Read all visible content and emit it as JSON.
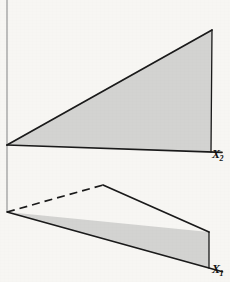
{
  "figure": {
    "title": "",
    "background_color": "#f7f6f3",
    "shade_color": "#d3d3d1",
    "line_color": "#1a1a1a",
    "axis_guide_color": "#8d8d8d",
    "labels": {
      "x2": {
        "base": "X",
        "subscript": "2",
        "name": "x2-axis-label"
      },
      "x1": {
        "base": "X",
        "subscript": "1",
        "name": "x1-axis-label"
      }
    },
    "geometry": {
      "description": "Two shaded planar wedges (cones) emanating from two vertices on a vertical reference line, crossing each other; hidden edge drawn dashed.",
      "vertical_guide": {
        "x": 7,
        "y_top": 0,
        "y_bottom": 212
      },
      "vertex_upper": {
        "x": 7,
        "y": 145
      },
      "vertex_lower": {
        "x": 7,
        "y": 212
      },
      "crossing_point": {
        "x": 103,
        "y": 185
      },
      "upper_wedge": {
        "apex": {
          "x": 7,
          "y": 145
        },
        "top_corner": {
          "x": 212,
          "y": 30
        },
        "bottom_corner": {
          "x": 211,
          "y": 152
        }
      },
      "lower_wedge": {
        "apex": {
          "x": 7,
          "y": 212
        },
        "top_corner": {
          "x": 209,
          "y": 232
        },
        "bottom_corner": {
          "x": 209,
          "y": 268
        }
      },
      "dashed_segment": {
        "from": {
          "x": 7,
          "y": 212
        },
        "to": {
          "x": 103,
          "y": 185
        }
      }
    }
  }
}
